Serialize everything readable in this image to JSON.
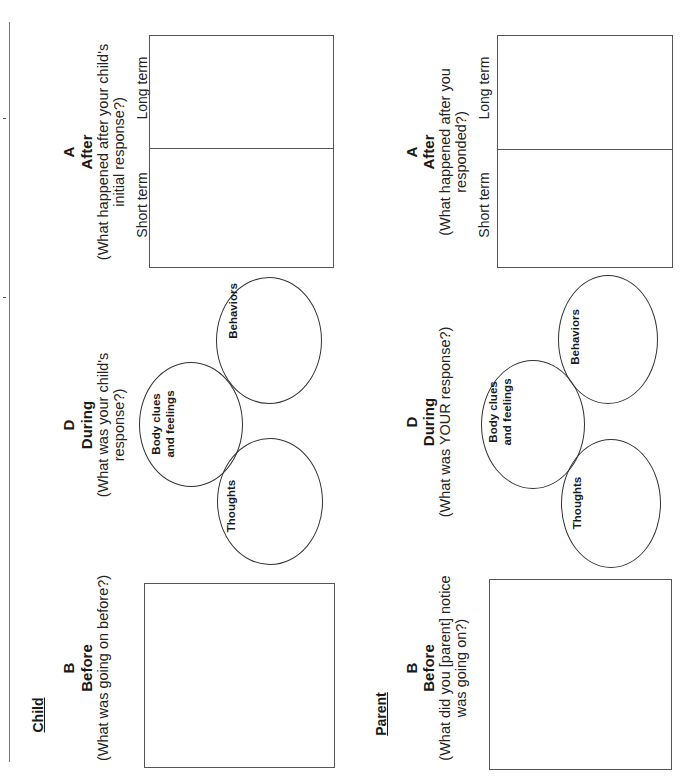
{
  "page": {
    "orientation": "rotated-90-ccw",
    "line_color": "#555555",
    "text_color": "#1a1a1a"
  },
  "child": {
    "section_label": "Child",
    "before": {
      "letter": "B",
      "heading": "Before",
      "question_lines": [
        "(What was going on before?)"
      ]
    },
    "during": {
      "letter": "D",
      "heading": "During",
      "question_lines": [
        "(What was your child's",
        "response?)"
      ],
      "circles": {
        "thoughts": "Thoughts",
        "body_line1": "Body clues",
        "body_line2": "and feelings",
        "behaviors": "Behaviors"
      }
    },
    "after": {
      "letter": "A",
      "heading": "After",
      "question_lines": [
        "(What happened after your child's",
        "initial response?)"
      ],
      "short_term": "Short term",
      "long_term": "Long term"
    }
  },
  "parent": {
    "section_label": "Parent",
    "before": {
      "letter": "B",
      "heading": "Before",
      "question_lines": [
        "(What did you [parent] notice",
        "was going on?)"
      ]
    },
    "during": {
      "letter": "D",
      "heading": "During",
      "question_lines": [
        "(What was YOUR response?)"
      ],
      "circles": {
        "thoughts": "Thoughts",
        "body_line1": "Body clues",
        "body_line2": "and feelings",
        "behaviors": "Behaviors"
      }
    },
    "after": {
      "letter": "A",
      "heading": "After",
      "question_lines": [
        "(What happened after you",
        "responded?)"
      ],
      "short_term": "Short term",
      "long_term": "Long term"
    }
  }
}
